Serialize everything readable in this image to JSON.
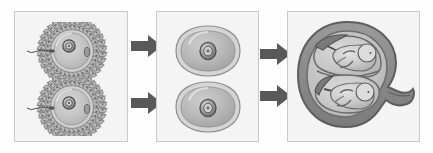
{
  "figure": {
    "title": "Dizygotic (fraternal) twin development",
    "background_color": "#fefefe",
    "panel_background": "#f4f4f4",
    "panel_border_color": "#c9c9c9",
    "arrow_color": "#595959",
    "ink_color": "#4a4a4a",
    "panel_count": 3,
    "arrow_count": 4
  },
  "panels": [
    {
      "id": "panel-1",
      "name": "fertilization-panel",
      "caption": "Two separate ova each fertilized by a sperm",
      "stage": "Fertilization",
      "items": [
        {
          "label": "Fertilized ovum with corona radiata (upper)",
          "name": "ovum-top"
        },
        {
          "label": "Fertilized ovum with corona radiata (lower)",
          "name": "ovum-bottom"
        }
      ]
    },
    {
      "id": "panel-2",
      "name": "zygote-panel",
      "caption": "Two separate zygotes",
      "stage": "Zygote",
      "items": [
        {
          "label": "Zygote (upper)",
          "name": "zygote-top"
        },
        {
          "label": "Zygote (lower)",
          "name": "zygote-bottom"
        }
      ]
    },
    {
      "id": "panel-3",
      "name": "uterus-panel",
      "caption": "Two fetuses in the uterus, each in its own amniotic sac with its own placenta",
      "stage": "Implantation and development",
      "items": [
        {
          "label": "Uterus with cervix",
          "name": "uterus"
        },
        {
          "label": "Fetus in amniotic sac (upper)",
          "name": "fetus-top"
        },
        {
          "label": "Fetus in amniotic sac (lower)",
          "name": "fetus-bottom"
        }
      ]
    }
  ],
  "arrows": [
    {
      "name": "arrow-panel1-top-to-panel2",
      "direction": "right",
      "icon": "arrow-right-icon"
    },
    {
      "name": "arrow-panel1-bottom-to-panel2",
      "direction": "right",
      "icon": "arrow-right-icon"
    },
    {
      "name": "arrow-panel2-top-to-panel3",
      "direction": "right",
      "icon": "arrow-right-icon"
    },
    {
      "name": "arrow-panel2-bottom-to-panel3",
      "direction": "right",
      "icon": "arrow-right-icon"
    }
  ],
  "chart_data": {
    "type": "diagram",
    "title": "Dizygotic (fraternal) twin development",
    "stages": [
      "Fertilization",
      "Zygote",
      "Implantation and development"
    ],
    "counts_per_stage": [
      2,
      2,
      2
    ],
    "flow": "two ova -> two zygotes -> two fetuses"
  }
}
